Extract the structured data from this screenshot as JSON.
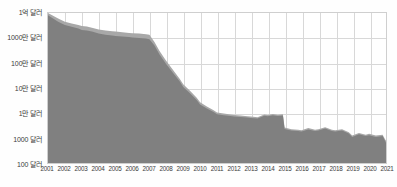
{
  "chart_data": {
    "type": "area",
    "title": "",
    "subtitle": "",
    "xlabel": "",
    "ylabel": "",
    "scale": "log",
    "grid": true,
    "legend": "none",
    "ylim": [
      100,
      100000000
    ],
    "ytick_labels": [
      "1억 달러",
      "1000만 달러",
      "100만 달러",
      "10만 달러",
      "1만 달러",
      "1000 달러",
      "100 달러"
    ],
    "ytick_values": [
      100000000,
      10000000,
      1000000,
      100000,
      10000,
      1000,
      100
    ],
    "categories": [
      "2001",
      "2002",
      "2003",
      "2004",
      "2005",
      "2006",
      "2007",
      "2008",
      "2009",
      "2010",
      "2011",
      "2012",
      "2013",
      "2014",
      "2015",
      "2016",
      "2017",
      "2018",
      "2019",
      "2020",
      "2021"
    ],
    "xlim": [
      2001,
      2021
    ],
    "colors": {
      "band_lower": "#808080",
      "band_upper": "#a8a8a8",
      "grid": "#d8d8d8",
      "frame": "#cfcfcf",
      "text": "#3b3b3b",
      "background": "#ffffff"
    },
    "series": [
      {
        "name": "lower-band",
        "x": [
          2001.0,
          2001.3,
          2001.6,
          2002.0,
          2002.4,
          2002.8,
          2003.0,
          2003.3,
          2003.6,
          2004.0,
          2004.4,
          2004.8,
          2005.0,
          2005.4,
          2005.8,
          2006.0,
          2006.4,
          2006.8,
          2007.0,
          2007.3,
          2007.6,
          2008.0,
          2008.4,
          2008.8,
          2009.0,
          2009.4,
          2009.8,
          2010.0,
          2010.4,
          2010.8,
          2011.0,
          2011.4,
          2011.8,
          2012.0,
          2012.4,
          2012.8,
          2013.0,
          2013.4,
          2013.8,
          2014.0,
          2014.3,
          2014.6,
          2014.9,
          2015.0,
          2015.4,
          2015.8,
          2016.0,
          2016.4,
          2016.8,
          2017.0,
          2017.4,
          2017.8,
          2018.0,
          2018.4,
          2018.8,
          2019.0,
          2019.4,
          2019.8,
          2020.0,
          2020.4,
          2020.8,
          2021.0
        ],
        "values": [
          82000000,
          60000000,
          45000000,
          33000000,
          28000000,
          24000000,
          21000000,
          20000000,
          18000000,
          15000000,
          13500000,
          12500000,
          12000000,
          11500000,
          11000000,
          10500000,
          10000000,
          9500000,
          9000000,
          5000000,
          2200000,
          900000,
          400000,
          180000,
          110000,
          62000,
          33000,
          22000,
          15000,
          11000,
          9000,
          8200,
          7600,
          7200,
          6900,
          6600,
          6300,
          6000,
          7800,
          7500,
          8200,
          7600,
          8000,
          2300,
          2000,
          1900,
          1800,
          2200,
          1900,
          2000,
          2400,
          1900,
          1800,
          2000,
          1500,
          1100,
          1400,
          1200,
          1300,
          1100,
          1200,
          650
        ]
      },
      {
        "name": "upper-band",
        "x": [
          2001.0,
          2001.3,
          2001.6,
          2002.0,
          2002.4,
          2002.8,
          2003.0,
          2003.3,
          2003.6,
          2004.0,
          2004.4,
          2004.8,
          2005.0,
          2005.4,
          2005.8,
          2006.0,
          2006.4,
          2006.8,
          2007.0,
          2007.3,
          2007.6,
          2008.0,
          2008.4,
          2008.8,
          2009.0,
          2009.4,
          2009.8,
          2010.0,
          2010.4,
          2010.8,
          2011.0,
          2011.4,
          2011.8,
          2012.0,
          2012.4,
          2012.8,
          2013.0,
          2013.4,
          2013.8,
          2014.0,
          2014.3,
          2014.6,
          2014.9,
          2015.0,
          2015.4,
          2015.8,
          2016.0,
          2016.4,
          2016.8,
          2017.0,
          2017.4,
          2017.8,
          2018.0,
          2018.4,
          2018.8,
          2019.0,
          2019.4,
          2019.8,
          2020.0,
          2020.4,
          2020.8,
          2021.0
        ],
        "values": [
          100000000,
          78000000,
          60000000,
          45000000,
          38000000,
          33000000,
          30000000,
          29000000,
          26000000,
          22000000,
          20000000,
          18500000,
          18000000,
          17000000,
          16000000,
          15500000,
          15000000,
          14000000,
          13500000,
          7000000,
          3000000,
          1200000,
          520000,
          230000,
          140000,
          78000,
          41000,
          27000,
          18000,
          13000,
          10500,
          9500,
          8800,
          8300,
          7900,
          7500,
          7200,
          6800,
          8800,
          8400,
          9200,
          8500,
          9000,
          2600,
          2250,
          2150,
          2050,
          2500,
          2150,
          2250,
          2700,
          2150,
          2050,
          2250,
          1700,
          1250,
          1600,
          1350,
          1480,
          1250,
          1360,
          760
        ]
      }
    ]
  }
}
